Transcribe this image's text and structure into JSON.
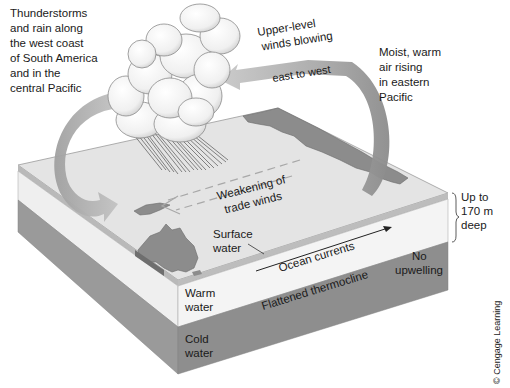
{
  "diagram": {
    "labels": {
      "thunderstorms": [
        "Thunderstorms",
        "and rain along",
        "the west coast",
        "of South America",
        "and in the",
        "central Pacific"
      ],
      "upper_winds": [
        "Upper-level",
        "winds blowing"
      ],
      "east_to_west": "east to west",
      "moist_air": [
        "Moist, warm",
        "air rising",
        "in eastern",
        "Pacific"
      ],
      "weakening": [
        "Weakening of",
        "trade winds"
      ],
      "surface_water": [
        "Surface",
        "water"
      ],
      "up_to": [
        "Up to",
        "170 m",
        "deep"
      ],
      "ocean_currents": "Ocean currents",
      "no_upwelling": [
        "No",
        "upwelling"
      ],
      "warm_water": [
        "Warm",
        "water"
      ],
      "flattened_thermocline": "Flattened thermocline",
      "cold_water": [
        "Cold",
        "water"
      ]
    },
    "credit": "© Cengage Learning",
    "colors": {
      "ocean_top": "#e6e6e6",
      "warm_layer": "#f2f2f2",
      "cold_layer": "#8f8f8f",
      "cold_layer_side": "#9c9c9c",
      "land": "#8a8a8a",
      "arrow": "#b5b5b5",
      "cloud": "#f7f7f7"
    }
  }
}
